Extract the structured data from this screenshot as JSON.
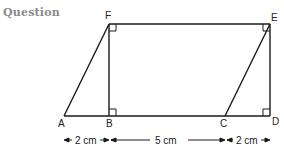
{
  "header": {
    "title": "Question"
  },
  "figure": {
    "vertices": {
      "A": {
        "label": "A",
        "x": 64,
        "y": 116
      },
      "B": {
        "label": "B",
        "x": 109,
        "y": 116
      },
      "C": {
        "label": "C",
        "x": 225,
        "y": 116
      },
      "D": {
        "label": "D",
        "x": 270,
        "y": 116
      },
      "E": {
        "label": "E",
        "x": 270,
        "y": 24
      },
      "F": {
        "label": "F",
        "x": 109,
        "y": 24
      }
    },
    "right_angles": [
      "F",
      "E",
      "B",
      "D"
    ],
    "dimensions": [
      {
        "from": "A",
        "to": "B",
        "label": "2 cm"
      },
      {
        "from": "B",
        "to": "C",
        "label": "5 cm"
      },
      {
        "from": "C",
        "to": "D",
        "label": "2 cm"
      }
    ]
  }
}
